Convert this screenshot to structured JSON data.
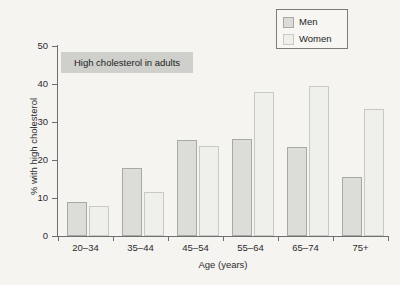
{
  "chart_data": {
    "type": "bar",
    "title": "High cholesterol in adults",
    "xlabel": "Age (years)",
    "ylabel": "% with high cholesterol",
    "categories": [
      "20–34",
      "35–44",
      "45–54",
      "55–64",
      "65–74",
      "75+"
    ],
    "series": [
      {
        "name": "Men",
        "values": [
          9.0,
          18.0,
          25.2,
          25.4,
          23.3,
          15.5
        ],
        "color": "#dcdcd8"
      },
      {
        "name": "Women",
        "values": [
          7.9,
          11.5,
          23.7,
          37.9,
          39.6,
          33.5
        ],
        "color": "#efefec"
      }
    ],
    "ylim": [
      0,
      50
    ],
    "yticks": [
      0,
      10,
      20,
      30,
      40,
      50
    ],
    "ytick_labels": [
      "0",
      "10",
      "20",
      "30",
      "40",
      "50"
    ],
    "grid": false,
    "legend_position": "top-right"
  },
  "legend": {
    "entries": [
      {
        "label": "Men"
      },
      {
        "label": "Women"
      }
    ]
  },
  "axes": {
    "x_title": "Age (years)",
    "y_title": "% with high cholesterol"
  },
  "banner": {
    "text": "High cholesterol in adults"
  }
}
